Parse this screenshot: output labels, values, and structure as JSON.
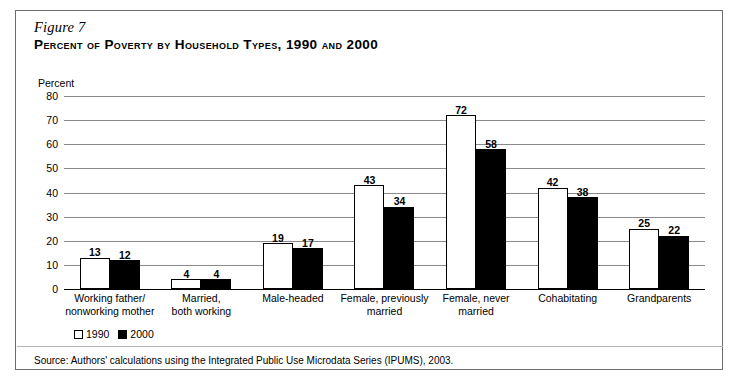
{
  "figure": {
    "number": "Figure 7",
    "title": "Percent of Poverty by Household Types, 1990 and 2000",
    "source": "Source: Authors' calculations using the Integrated Public Use Microdata Series (IPUMS), 2003."
  },
  "legend": {
    "items": [
      {
        "label": "1990",
        "swatch": "white-square"
      },
      {
        "label": "2000",
        "swatch": "black-square"
      }
    ]
  },
  "chart_data": {
    "type": "bar",
    "title": "Percent of Poverty by Household Types, 1990 and 2000",
    "xlabel": "",
    "ylabel": "Percent",
    "ylim": [
      0,
      80
    ],
    "yticks": [
      0,
      10,
      20,
      30,
      40,
      50,
      60,
      70,
      80
    ],
    "ytick_labels": [
      "0",
      "10",
      "20",
      "30",
      "40",
      "50",
      "60",
      "70",
      "80"
    ],
    "grid": true,
    "legend_position": "bottom-left",
    "categories": [
      "Working father/\nnonworking mother",
      "Married,\nboth working",
      "Male-headed",
      "Female, previously\nmarried",
      "Female, never\nmarried",
      "Cohabitating",
      "Grandparents"
    ],
    "category_lines": [
      [
        "Working father/",
        "nonworking mother"
      ],
      [
        "Married,",
        "both working"
      ],
      [
        "Male-headed"
      ],
      [
        "Female, previously",
        "married"
      ],
      [
        "Female, never",
        "married"
      ],
      [
        "Cohabitating"
      ],
      [
        "Grandparents"
      ]
    ],
    "series": [
      {
        "name": "1990",
        "color": "#ffffff",
        "edgecolor": "#000000",
        "values": [
          13,
          4,
          19,
          43,
          72,
          42,
          25
        ]
      },
      {
        "name": "2000",
        "color": "#000000",
        "edgecolor": "#000000",
        "values": [
          12,
          4,
          17,
          34,
          58,
          38,
          22
        ]
      }
    ],
    "value_labels": true
  }
}
